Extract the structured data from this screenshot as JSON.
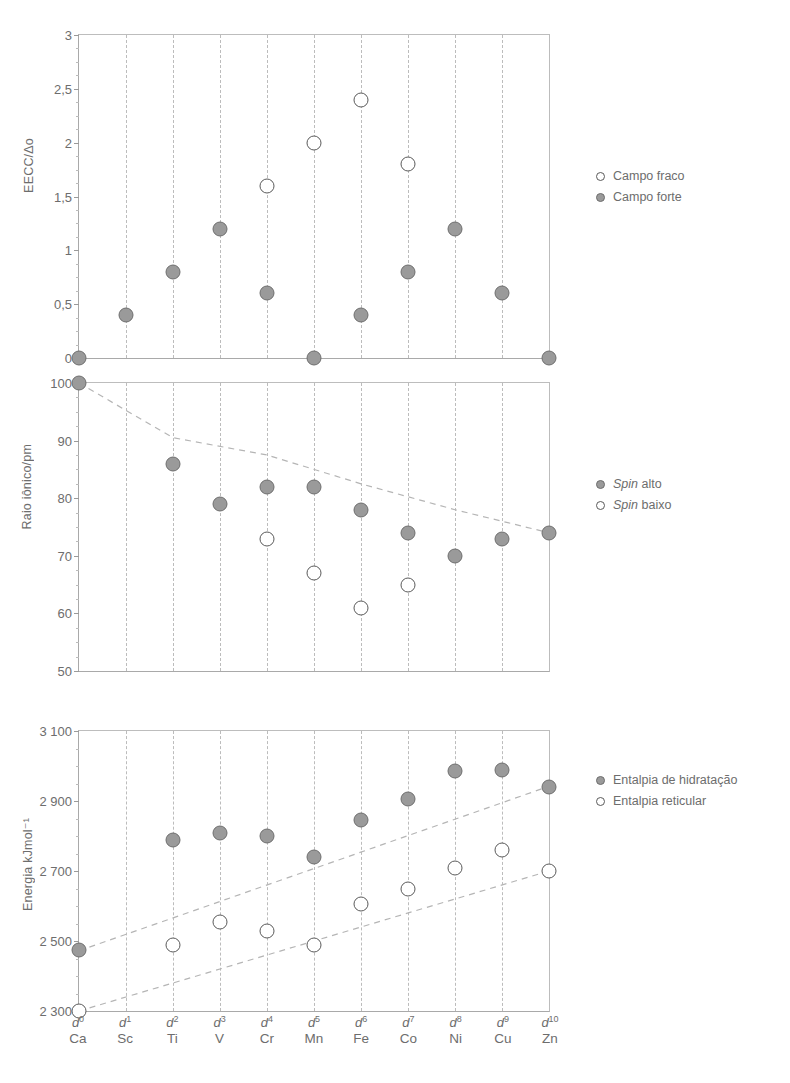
{
  "figure": {
    "categories_orbital": [
      "d0",
      "d1",
      "d2",
      "d3",
      "d4",
      "d5",
      "d6",
      "d7",
      "d8",
      "d9",
      "d10"
    ],
    "categories_orbital_sup": [
      "0",
      "1",
      "2",
      "3",
      "4",
      "5",
      "6",
      "7",
      "8",
      "9",
      "10"
    ],
    "categories_element": [
      "Ca",
      "Sc",
      "Ti",
      "V",
      "Cr",
      "Mn",
      "Fe",
      "Co",
      "Ni",
      "Cu",
      "Zn"
    ],
    "marker_fill_color": "#9a9a9a",
    "marker_edge_color": "#6e6e6e",
    "open_marker_edge_color": "#5a5a5a",
    "grid_color": "#bcbcbc",
    "axis_color": "#9a9a9a",
    "text_color": "#6d6d6d"
  },
  "chart_data": [
    {
      "id": "eecc",
      "type": "scatter",
      "title": "",
      "xlabel": "",
      "ylabel": "EECC/Δo",
      "ylim": [
        0,
        3
      ],
      "yticks": [
        0,
        0.5,
        1,
        1.5,
        2,
        2.5,
        3
      ],
      "yticklabels": [
        "0",
        "0,5",
        "1",
        "1,5",
        "2",
        "2,5",
        "3"
      ],
      "grid": true,
      "legend_position": "right",
      "categories": [
        "d0",
        "d1",
        "d2",
        "d3",
        "d4",
        "d5",
        "d6",
        "d7",
        "d8",
        "d9",
        "d10"
      ],
      "series": [
        {
          "name": "Campo fraco",
          "marker": "open",
          "values": [
            null,
            null,
            null,
            null,
            1.6,
            2.0,
            2.4,
            1.8,
            null,
            null,
            null
          ]
        },
        {
          "name": "Campo forte",
          "marker": "filled",
          "values": [
            0,
            0.4,
            0.8,
            1.2,
            0.6,
            0,
            0.4,
            0.8,
            1.2,
            0.6,
            0
          ]
        }
      ]
    },
    {
      "id": "raio",
      "type": "scatter",
      "title": "",
      "xlabel": "",
      "ylabel": "Raio iônico/pm",
      "ylim": [
        50,
        100
      ],
      "yticks": [
        50,
        60,
        70,
        80,
        90,
        100
      ],
      "yticklabels": [
        "50",
        "60",
        "70",
        "80",
        "90",
        "100"
      ],
      "grid": true,
      "legend_position": "right",
      "categories": [
        "d0",
        "d1",
        "d2",
        "d3",
        "d4",
        "d5",
        "d6",
        "d7",
        "d8",
        "d9",
        "d10"
      ],
      "series": [
        {
          "name": "Spin alto",
          "name_italic_prefix": "Spin",
          "name_rest": " alto",
          "marker": "filled",
          "values": [
            100,
            null,
            86,
            79,
            82,
            82,
            78,
            74,
            70,
            73,
            74
          ]
        },
        {
          "name": "Spin baixo",
          "name_italic_prefix": "Spin",
          "name_rest": " baixo",
          "marker": "open",
          "values": [
            null,
            null,
            null,
            null,
            73,
            67,
            61,
            65,
            null,
            null,
            null
          ]
        }
      ],
      "trendlines": [
        {
          "name": "tendencia-raio",
          "points": [
            [
              0,
              100
            ],
            [
              2,
              90.5
            ],
            [
              4,
              87.5
            ],
            [
              6,
              82.5
            ],
            [
              8,
              78
            ],
            [
              10,
              74
            ]
          ]
        }
      ]
    },
    {
      "id": "energia",
      "type": "scatter",
      "title": "",
      "xlabel": "",
      "ylabel": "Energia kJmol⁻¹",
      "ylim": [
        2300,
        3100
      ],
      "yticks": [
        2300,
        2500,
        2700,
        2900,
        3100
      ],
      "yticklabels": [
        "2 300",
        "2 500",
        "2 700",
        "2 900",
        "3 100"
      ],
      "grid": true,
      "legend_position": "right",
      "categories": [
        "d0",
        "d1",
        "d2",
        "d3",
        "d4",
        "d5",
        "d6",
        "d7",
        "d8",
        "d9",
        "d10"
      ],
      "series": [
        {
          "name": "Entalpia de hidratação",
          "marker": "filled",
          "values": [
            2475,
            null,
            2790,
            2810,
            2800,
            2740,
            2845,
            2905,
            2985,
            2990,
            2940
          ]
        },
        {
          "name": "Entalpia reticular",
          "marker": "open",
          "values": [
            2300,
            null,
            2490,
            2555,
            2530,
            2490,
            2605,
            2650,
            2710,
            2760,
            2700
          ]
        }
      ],
      "trendlines": [
        {
          "name": "tendencia-hidratacao",
          "points": [
            [
              0,
              2472
            ],
            [
              10,
              2942
            ]
          ]
        },
        {
          "name": "tendencia-reticular",
          "points": [
            [
              0,
              2300
            ],
            [
              10,
              2700
            ]
          ]
        }
      ]
    }
  ],
  "legends": {
    "eecc": [
      {
        "marker": "open",
        "label": "Campo fraco"
      },
      {
        "marker": "filled",
        "label": "Campo forte"
      }
    ],
    "raio": [
      {
        "marker": "filled",
        "label_italic": "Spin",
        "label_rest": " alto"
      },
      {
        "marker": "open",
        "label_italic": "Spin",
        "label_rest": " baixo"
      }
    ],
    "energia": [
      {
        "marker": "filled",
        "label": "Entalpia de hidratação"
      },
      {
        "marker": "open",
        "label": "Entalpia reticular"
      }
    ]
  }
}
